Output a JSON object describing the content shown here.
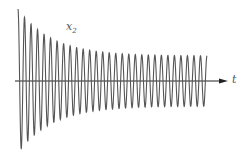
{
  "figure": {
    "signal_label": "x",
    "signal_subscript": "2",
    "axis_label": "t"
  },
  "chart_data": {
    "type": "line",
    "title": "",
    "xlabel": "t",
    "ylabel": "x2",
    "legend": [],
    "grid": false,
    "series": [
      {
        "name": "x2",
        "model": "A_ss*sin(w t) + A_tr*exp(-t/tau)*cos(w t)",
        "cycles": 29,
        "initial_amplitude": 72,
        "steady_amplitude": 25,
        "decay_fraction": 0.18
      }
    ],
    "axis": {
      "x_start": 15,
      "x_end": 228,
      "y": 81
    },
    "wave": {
      "x_start": 18,
      "x_end": 207
    },
    "colors": {
      "curve": "#555555",
      "axis": "#222222"
    }
  }
}
